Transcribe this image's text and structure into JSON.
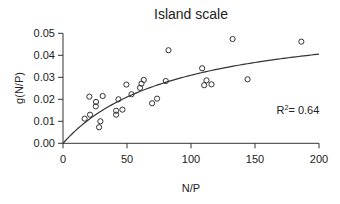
{
  "chart_data": {
    "type": "scatter",
    "title": "Island scale",
    "xlabel": "N/P",
    "ylabel": "g(N/P)",
    "xlim": [
      0,
      200
    ],
    "ylim": [
      0,
      0.05
    ],
    "xticks": [
      0,
      50,
      100,
      150,
      200
    ],
    "xtick_labels": [
      "0",
      "50",
      "100",
      "150",
      "200"
    ],
    "yticks": [
      0,
      0.01,
      0.02,
      0.03,
      0.04,
      0.05
    ],
    "ytick_labels": [
      "0.00",
      "0.01",
      "0.02",
      "0.03",
      "0.04",
      "0.05"
    ],
    "grid": false,
    "legend": null,
    "annotation": {
      "text_base": "R",
      "text_sup": "2",
      "text_rest": "= 0.64",
      "x": 170,
      "y": 0.0135
    },
    "series": [
      {
        "name": "observations",
        "marker": "open-circle",
        "points": [
          [
            16.9,
            0.0112
          ],
          [
            20.6,
            0.0212
          ],
          [
            21.1,
            0.013
          ],
          [
            25.8,
            0.0188
          ],
          [
            25.6,
            0.0168
          ],
          [
            28.2,
            0.0073
          ],
          [
            29.2,
            0.01
          ],
          [
            31.0,
            0.0215
          ],
          [
            41.5,
            0.0148
          ],
          [
            41.5,
            0.013
          ],
          [
            43.3,
            0.02
          ],
          [
            46.4,
            0.0153
          ],
          [
            49.5,
            0.0267
          ],
          [
            53.5,
            0.0223
          ],
          [
            60.2,
            0.0252
          ],
          [
            61.3,
            0.0271
          ],
          [
            63.1,
            0.0288
          ],
          [
            69.6,
            0.0182
          ],
          [
            73.5,
            0.0203
          ],
          [
            80.3,
            0.0283
          ],
          [
            82.4,
            0.0423
          ],
          [
            108.7,
            0.0341
          ],
          [
            110.3,
            0.0264
          ],
          [
            112.1,
            0.0286
          ],
          [
            116.0,
            0.0268
          ],
          [
            132.5,
            0.0474
          ],
          [
            144.2,
            0.0291
          ],
          [
            186.2,
            0.0462
          ]
        ]
      },
      {
        "name": "fitted curve",
        "type": "line",
        "model": "saturating",
        "params": {
          "a": 0.0587,
          "b": 89.7
        }
      }
    ],
    "r_squared": 0.64
  },
  "colors": {
    "axis": "#333333",
    "marker": "#333333",
    "curve": "#333333",
    "text": "#222222"
  }
}
